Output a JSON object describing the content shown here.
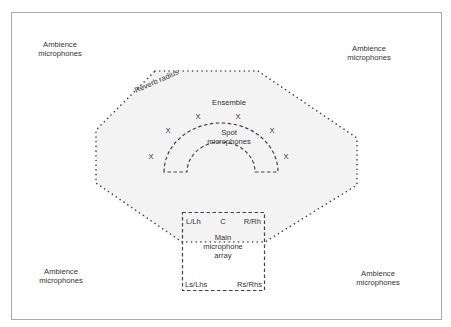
{
  "diagram": {
    "labels": {
      "ambience_top_left": [
        "Ambience",
        "microphones"
      ],
      "ambience_top_right": [
        "Ambience",
        "microphones"
      ],
      "ambience_bottom_left": [
        "Ambience",
        "microphones"
      ],
      "ambience_bottom_right": [
        "Ambience",
        "microphones"
      ],
      "reverb_radius": "Reverb radius",
      "ensemble": "Ensemble",
      "spot_microphones": [
        "Spot",
        "microphones"
      ],
      "main_array": [
        "Main",
        "microphone",
        "array"
      ],
      "channel_l": "L/Lh",
      "channel_c": "C",
      "channel_r": "R/Rh",
      "channel_ls": "Ls/Lhs",
      "channel_rs": "Rs/Rhs"
    },
    "ensemble_marker": "X",
    "colors": {
      "frame": "#aaaaaa",
      "reverb_fill": "#f2f2f2",
      "stroke": "#444444",
      "text": "#333333"
    }
  }
}
